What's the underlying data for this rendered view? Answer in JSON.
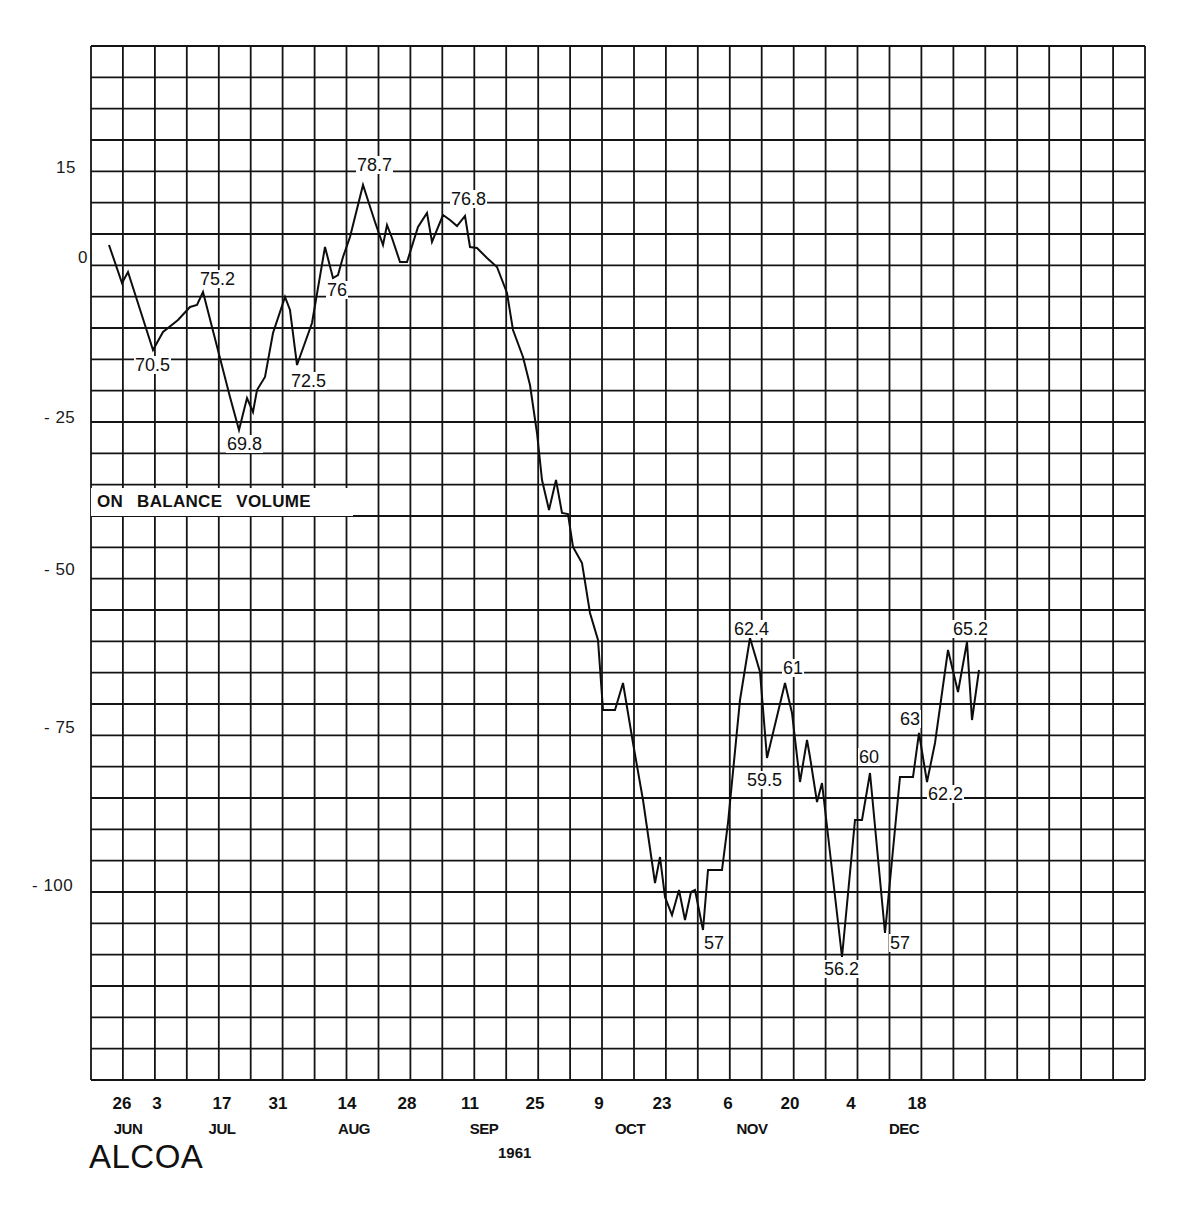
{
  "chart_data": {
    "type": "line",
    "title": "ALCOA",
    "subtitle": "ON BALANCE VOLUME",
    "year": "1961",
    "xlabel": "",
    "ylabel": "",
    "grid": true,
    "legend": null,
    "ylim": [
      -130,
      35
    ],
    "y_ticks": [
      {
        "label": "15",
        "value": 15
      },
      {
        "label": "0",
        "value": 0
      },
      {
        "label": "- 25",
        "value": -25
      },
      {
        "label": "- 50",
        "value": -50
      },
      {
        "label": "- 75",
        "value": -75
      },
      {
        "label": "- 100",
        "value": -100
      }
    ],
    "x_ticks": [
      {
        "day": "26",
        "month": "JUN"
      },
      {
        "day": "3",
        "month": "JUL"
      },
      {
        "day": "17",
        "month": "JUL"
      },
      {
        "day": "31",
        "month": "JUL"
      },
      {
        "day": "14",
        "month": "AUG"
      },
      {
        "day": "28",
        "month": "AUG"
      },
      {
        "day": "11",
        "month": "SEP"
      },
      {
        "day": "25",
        "month": "SEP"
      },
      {
        "day": "9",
        "month": "OCT"
      },
      {
        "day": "23",
        "month": "OCT"
      },
      {
        "day": "6",
        "month": "NOV"
      },
      {
        "day": "20",
        "month": "NOV"
      },
      {
        "day": "4",
        "month": "DEC"
      },
      {
        "day": "18",
        "month": "DEC"
      }
    ],
    "month_labels": [
      "JUN",
      "JUL",
      "AUG",
      "SEP",
      "OCT",
      "NOV",
      "DEC"
    ],
    "series": [
      {
        "name": "On Balance Volume",
        "points_px": [
          [
            109,
            245
          ],
          [
            122,
            283
          ],
          [
            128,
            272
          ],
          [
            153,
            350
          ],
          [
            163,
            332
          ],
          [
            178,
            320
          ],
          [
            190,
            307
          ],
          [
            197,
            305
          ],
          [
            203,
            292
          ],
          [
            230,
            397
          ],
          [
            239,
            430
          ],
          [
            247,
            398
          ],
          [
            253,
            412
          ],
          [
            257,
            390
          ],
          [
            265,
            377
          ],
          [
            273,
            333
          ],
          [
            285,
            297
          ],
          [
            290,
            310
          ],
          [
            297,
            365
          ],
          [
            312,
            323
          ],
          [
            325,
            247
          ],
          [
            333,
            278
          ],
          [
            338,
            275
          ],
          [
            343,
            257
          ],
          [
            350,
            237
          ],
          [
            363,
            185
          ],
          [
            375,
            222
          ],
          [
            383,
            245
          ],
          [
            387,
            225
          ],
          [
            392,
            238
          ],
          [
            400,
            262
          ],
          [
            407,
            262
          ],
          [
            418,
            227
          ],
          [
            427,
            213
          ],
          [
            432,
            242
          ],
          [
            443,
            215
          ],
          [
            450,
            220
          ],
          [
            457,
            226
          ],
          [
            465,
            216
          ],
          [
            470,
            247
          ],
          [
            477,
            248
          ],
          [
            487,
            258
          ],
          [
            497,
            267
          ],
          [
            507,
            293
          ],
          [
            513,
            330
          ],
          [
            523,
            357
          ],
          [
            530,
            385
          ],
          [
            537,
            433
          ],
          [
            542,
            480
          ],
          [
            549,
            510
          ],
          [
            556,
            480
          ],
          [
            562,
            513
          ],
          [
            568,
            514
          ],
          [
            573,
            547
          ],
          [
            582,
            563
          ],
          [
            590,
            613
          ],
          [
            598,
            640
          ],
          [
            603,
            710
          ],
          [
            615,
            710
          ],
          [
            623,
            683
          ],
          [
            633,
            743
          ],
          [
            643,
            800
          ],
          [
            655,
            883
          ],
          [
            660,
            857
          ],
          [
            665,
            897
          ],
          [
            672,
            915
          ],
          [
            679,
            890
          ],
          [
            685,
            920
          ],
          [
            691,
            892
          ],
          [
            695,
            890
          ],
          [
            703,
            930
          ],
          [
            708,
            870
          ],
          [
            722,
            870
          ],
          [
            728,
            823
          ],
          [
            740,
            700
          ],
          [
            750,
            638
          ],
          [
            760,
            672
          ],
          [
            767,
            758
          ],
          [
            785,
            683
          ],
          [
            792,
            713
          ],
          [
            800,
            782
          ],
          [
            807,
            740
          ],
          [
            810,
            757
          ],
          [
            817,
            802
          ],
          [
            822,
            783
          ],
          [
            842,
            957
          ],
          [
            855,
            820
          ],
          [
            862,
            820
          ],
          [
            870,
            773
          ],
          [
            885,
            933
          ],
          [
            900,
            777
          ],
          [
            913,
            777
          ],
          [
            919,
            733
          ],
          [
            927,
            782
          ],
          [
            935,
            743
          ],
          [
            948,
            650
          ],
          [
            958,
            692
          ],
          [
            967,
            642
          ],
          [
            972,
            720
          ],
          [
            979,
            670
          ]
        ],
        "approx_obv_values": [
          3,
          -3,
          -1,
          -14,
          -11,
          -9,
          -7,
          -6,
          -4,
          -21,
          -26,
          -21,
          -23,
          -19,
          -17,
          -10,
          -5,
          -7,
          -15,
          -9,
          3,
          -2,
          -2,
          1,
          4,
          12,
          6,
          2,
          5,
          3,
          -1,
          -1,
          5,
          7,
          2,
          7,
          6,
          5,
          7,
          2,
          2,
          0,
          -1,
          -5,
          -11,
          -15,
          -20,
          -28,
          -35,
          -40,
          -35,
          -40,
          -40,
          -46,
          -48,
          -56,
          -61,
          -72,
          -72,
          -67,
          -81,
          -90,
          -103,
          -99,
          -105,
          -108,
          -104,
          -109,
          -104,
          -104,
          -110,
          -101,
          -101,
          -93,
          -74,
          -64,
          -69,
          -83,
          -71,
          -76,
          -87,
          -80,
          -83,
          -90,
          -87,
          -114,
          -92,
          -92,
          -85,
          -110,
          -86,
          -86,
          -79,
          -86,
          -80,
          -66,
          -72,
          -64,
          -77,
          -69
        ]
      }
    ],
    "annotations": [
      {
        "text": "70.5",
        "note": "price low late Jun/early Jul"
      },
      {
        "text": "75.2",
        "note": "price high mid Jul"
      },
      {
        "text": "69.8",
        "note": "price low late Jul"
      },
      {
        "text": "72.5",
        "note": "price low early Aug"
      },
      {
        "text": "76",
        "note": "price early Aug"
      },
      {
        "text": "78.7",
        "note": "price high mid Aug"
      },
      {
        "text": "76.8",
        "note": "price early Sep"
      },
      {
        "text": "57",
        "note": "price low late Oct"
      },
      {
        "text": "62.4",
        "note": "price high mid Nov"
      },
      {
        "text": "61",
        "note": "price high late Nov"
      },
      {
        "text": "59.5",
        "note": "price low mid Nov"
      },
      {
        "text": "56.2",
        "note": "price low early Dec"
      },
      {
        "text": "60",
        "note": "price early Dec"
      },
      {
        "text": "57",
        "note": "price low mid Dec"
      },
      {
        "text": "63",
        "note": "price mid Dec"
      },
      {
        "text": "62.2",
        "note": "price late Dec"
      },
      {
        "text": "65.2",
        "note": "price high late Dec"
      }
    ]
  },
  "layout": {
    "grid": {
      "left": 91,
      "top": 46,
      "right": 1145,
      "bottom": 1080,
      "cols": 33,
      "rows": 33
    },
    "obv_band_rows": [
      14
    ]
  }
}
